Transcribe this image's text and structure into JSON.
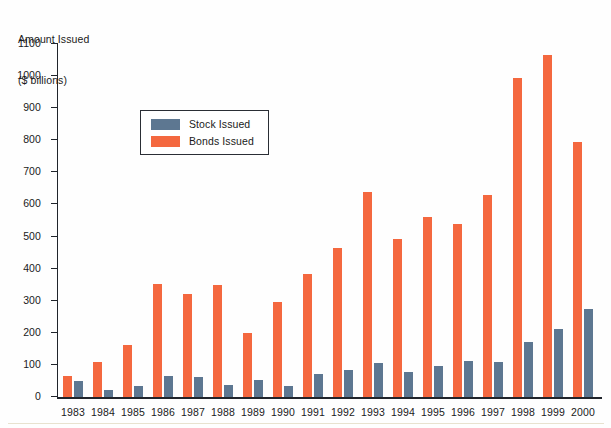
{
  "axis_title": {
    "line1": "Amount Issued",
    "line2": "($ billions)"
  },
  "legend": {
    "items": [
      {
        "label": "Stock Issued",
        "color": "#5d7791",
        "key": "stock"
      },
      {
        "label": "Bonds Issued",
        "color": "#f4683f",
        "key": "bonds"
      }
    ]
  },
  "colors": {
    "stock": "#5d7791",
    "bonds": "#f4683f",
    "axis": "#20242b",
    "text": "#1a1a1a",
    "background": "#fefefe"
  },
  "y_axis": {
    "ticks": [
      0,
      100,
      200,
      300,
      400,
      500,
      600,
      700,
      800,
      900,
      1000,
      1100
    ],
    "tick_labels": [
      "0",
      "100",
      "200",
      "300",
      "400",
      "500",
      "600",
      "700",
      "800",
      "900",
      "1000",
      "1100"
    ],
    "min": 0,
    "max": 1100
  },
  "chart_data": {
    "type": "bar",
    "title": "",
    "subtitle": "",
    "xlabel": "",
    "ylabel": "Amount Issued ($ billions)",
    "ylim": [
      0,
      1100
    ],
    "grid": false,
    "legend_position": "upper-left-inside",
    "bar_order": [
      "bonds",
      "stock"
    ],
    "categories": [
      "1983",
      "1984",
      "1985",
      "1986",
      "1987",
      "1988",
      "1989",
      "1990",
      "1991",
      "1992",
      "1993",
      "1994",
      "1995",
      "1996",
      "1997",
      "1998",
      "1999",
      "2000"
    ],
    "series": [
      {
        "name": "Bonds Issued",
        "color": "#f4683f",
        "values": [
          67,
          108,
          163,
          352,
          322,
          348,
          198,
          295,
          384,
          465,
          640,
          492,
          562,
          538,
          630,
          993,
          1065,
          795
        ]
      },
      {
        "name": "Stock Issued",
        "color": "#5d7791",
        "values": [
          49,
          21,
          33,
          66,
          63,
          39,
          54,
          35,
          71,
          83,
          106,
          78,
          98,
          113,
          108,
          171,
          211,
          273
        ]
      }
    ]
  }
}
